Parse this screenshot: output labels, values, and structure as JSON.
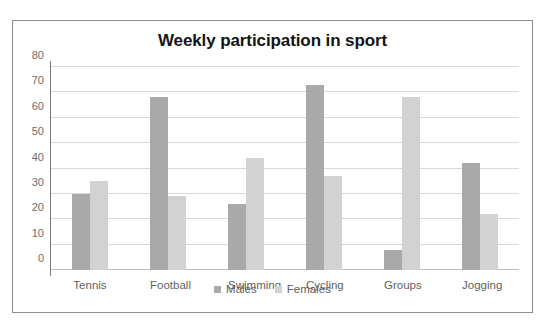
{
  "scan": {
    "top_cut_text": "Write a short re..."
  },
  "chart_data": {
    "type": "bar",
    "title": "Weekly participation in sport",
    "xlabel": "",
    "ylabel": "",
    "ylim": [
      0,
      80
    ],
    "yticks": [
      0,
      10,
      20,
      30,
      40,
      50,
      60,
      70,
      80
    ],
    "grid": true,
    "legend_position": "bottom",
    "categories": [
      "Tennis",
      "Football",
      "Swimming",
      "Cycling",
      "Groups",
      "Jogging"
    ],
    "series": [
      {
        "name": "Males",
        "color": "#a9a9a9",
        "values": [
          30,
          68,
          26,
          73,
          8,
          42
        ]
      },
      {
        "name": "Females",
        "color": "#d2d2d2",
        "values": [
          35,
          29,
          44,
          37,
          68,
          22
        ]
      }
    ]
  }
}
